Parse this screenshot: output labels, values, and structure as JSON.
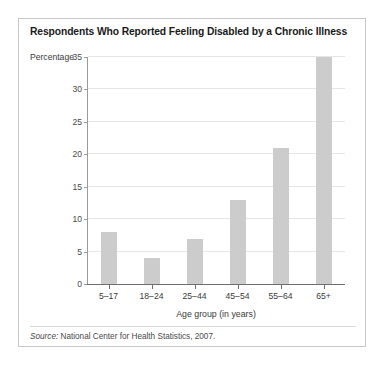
{
  "chart_data": {
    "type": "bar",
    "title": "Respondents Who Reported Feeling Disabled by a Chronic Illness",
    "categories": [
      "5–17",
      "18–24",
      "25–44",
      "45–54",
      "55–64",
      "65+"
    ],
    "values": [
      8,
      4,
      7,
      13,
      21,
      35
    ],
    "xlabel": "Age group (in years)",
    "ylabel": "Percentage",
    "ylim": [
      0,
      35
    ],
    "yticks": [
      0,
      5,
      10,
      15,
      20,
      25,
      30,
      35
    ],
    "ytick_labels": [
      "0",
      "5",
      "10",
      "15",
      "20",
      "25",
      "30",
      "35"
    ],
    "grid": true,
    "legend": "none",
    "bar_color": "#cccccc",
    "source_label": "Source:",
    "source_text": "National Center for Health Statistics, 2007."
  }
}
